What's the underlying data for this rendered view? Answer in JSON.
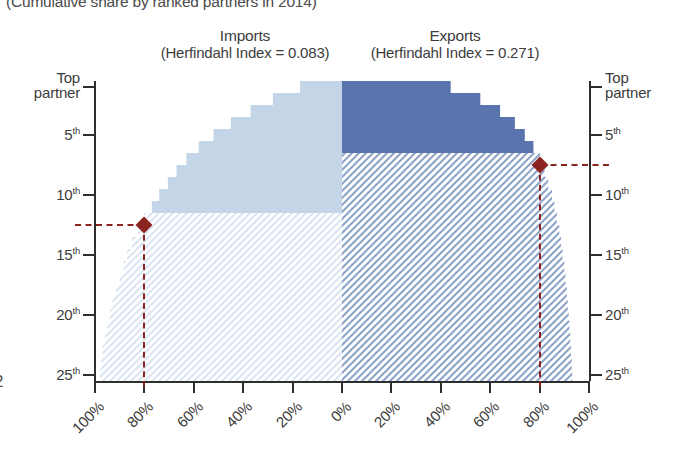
{
  "subtitle": "(Cumulative share by ranked partners in 2014)",
  "page_marker": "2",
  "panels": {
    "imports": {
      "title": "Imports",
      "index_label": "(Herfindahl Index = 0.083)",
      "herfindahl_index": 0.083,
      "color_solid": "#c5d5e8",
      "color_hatch": "#dce6f2"
    },
    "exports": {
      "title": "Exports",
      "index_label": "(Herfindahl Index = 0.271)",
      "herfindahl_index": 0.271,
      "color_solid": "#5a74ad",
      "color_hatch": "#8fa4c9"
    }
  },
  "marker_color": "#8b2320",
  "axis": {
    "y_title_left": "Top\npartner",
    "y_ticks": [
      "Top partner",
      "5th",
      "10th",
      "15th",
      "20th",
      "25th"
    ],
    "y_tick_ranks": [
      1,
      5,
      10,
      15,
      20,
      25
    ],
    "x_ticks_left": [
      "100%",
      "80%",
      "60%",
      "40%",
      "20%",
      "0%"
    ],
    "x_ticks_right": [
      "20%",
      "40%",
      "60%",
      "80%",
      "100%"
    ]
  },
  "chart_data": {
    "type": "area",
    "subtitle": "(Cumulative share by ranked partners in 2014)",
    "xlabel": "Cumulative share (%)",
    "ylabel": "Partner rank",
    "orientation": "mirrored-horizontal",
    "xlim": [
      0,
      100
    ],
    "ylim": [
      1,
      25
    ],
    "grid": false,
    "legend": "panel-titles",
    "y_categories": [
      "Top partner",
      "2nd",
      "3rd",
      "4th",
      "5th",
      "6th",
      "7th",
      "8th",
      "9th",
      "10th",
      "11th",
      "12th",
      "13th",
      "14th",
      "15th",
      "16th",
      "17th",
      "18th",
      "19th",
      "20th",
      "21st",
      "22nd",
      "23rd",
      "24th",
      "25th"
    ],
    "series": [
      {
        "name": "Imports",
        "direction": "left",
        "herfindahl_index": 0.083,
        "color": "#c5d5e8",
        "marker_rank": 12,
        "marker_value": 80,
        "cumulative_share": [
          17,
          28,
          37,
          45,
          52,
          58,
          63,
          67,
          70.5,
          74,
          77,
          80,
          82.5,
          85,
          87,
          88.5,
          90,
          91.5,
          93,
          94,
          95,
          96,
          97,
          97.5,
          98
        ]
      },
      {
        "name": "Exports",
        "direction": "right",
        "herfindahl_index": 0.271,
        "color": "#5a74ad",
        "marker_rank": 7,
        "marker_value": 80,
        "cumulative_share": [
          44,
          56,
          64,
          70,
          74,
          77.5,
          80,
          82,
          83.5,
          85,
          86,
          87,
          88,
          88.7,
          89.3,
          90,
          90.5,
          91,
          91.4,
          91.8,
          92.1,
          92.4,
          92.7,
          93,
          93.2
        ]
      }
    ],
    "annotations": [
      {
        "name": "imports-80pct-marker",
        "series": "Imports",
        "rank": 12,
        "share": 80,
        "label": "80% reached at 12th partner"
      },
      {
        "name": "exports-80pct-marker",
        "series": "Exports",
        "rank": 7,
        "share": 80,
        "label": "80% reached at 7th partner"
      }
    ]
  }
}
